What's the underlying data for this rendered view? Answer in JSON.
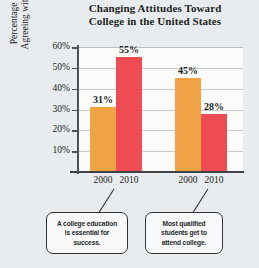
{
  "chart_data": {
    "type": "bar",
    "title": "Changing Attitudes Toward College in the United States",
    "title_lines": [
      "Changing Attitudes Toward",
      "College in the United States"
    ],
    "xlabel": "",
    "ylabel": "Percentage of U.S. Adults Agreeing with the Statement",
    "ylabel_lines": [
      "Percentage of U.S. Adults",
      "Agreeing with the Statement"
    ],
    "ylim": [
      0,
      60
    ],
    "ytick_labels": [
      "60%",
      "50%",
      "40%",
      "30%",
      "20%",
      "10%"
    ],
    "ytick_values": [
      60,
      50,
      40,
      30,
      20,
      10
    ],
    "grid": true,
    "legend": "none",
    "categories": [
      "2000",
      "2010",
      "2000",
      "2010"
    ],
    "values": [
      31,
      55,
      45,
      28
    ],
    "value_labels": [
      "31%",
      "55%",
      "45%",
      "28%"
    ],
    "colors": [
      "#f0a244",
      "#ee4b55",
      "#f0a244",
      "#ee4b55"
    ],
    "groups": [
      {
        "statement": "A college education is essential for success.",
        "bars": [
          {
            "category": "2000",
            "value": 31,
            "label": "31%",
            "color": "#f0a244"
          },
          {
            "category": "2010",
            "value": 55,
            "label": "55%",
            "color": "#ee4b55"
          }
        ]
      },
      {
        "statement": "Most qualified students get to attend college.",
        "bars": [
          {
            "category": "2000",
            "value": 45,
            "label": "45%",
            "color": "#f0a244"
          },
          {
            "category": "2010",
            "value": 28,
            "label": "28%",
            "color": "#ee4b55"
          }
        ]
      }
    ]
  },
  "callouts": [
    {
      "id": "callout-essential",
      "lines": [
        "A college education",
        "is essential for",
        "success."
      ]
    },
    {
      "id": "callout-qualified",
      "lines": [
        "Most qualified",
        "students get to",
        "attend college."
      ]
    }
  ],
  "colors": {
    "orange": "#f0a244",
    "red": "#ee4b55",
    "background": "#e9ecee",
    "plot_background": "#fbfbfa",
    "axis": "#3c4247",
    "grid": "#c6cbd0",
    "text": "#1d1f22"
  }
}
